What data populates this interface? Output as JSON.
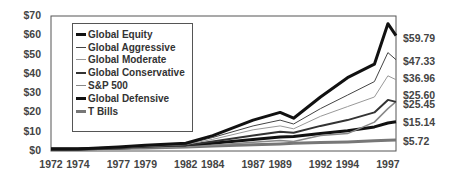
{
  "chart_data": {
    "type": "line",
    "title": "",
    "xlabel": "",
    "ylabel": "",
    "ylim": [
      0,
      70
    ],
    "y_ticks": [
      "$0",
      "$10",
      "$20",
      "$30",
      "$40",
      "$50",
      "$60",
      "$70"
    ],
    "x_ticks": [
      "1972",
      "1974",
      "1977",
      "1979",
      "1982",
      "1984",
      "1987",
      "1989",
      "1992",
      "1994",
      "1997"
    ],
    "grid": false,
    "legend_position": "upper-left-inside",
    "x": [
      1972,
      1974,
      1977,
      1979,
      1982,
      1984,
      1987,
      1989,
      1990,
      1992,
      1994,
      1996,
      1997,
      1997.6
    ],
    "series": [
      {
        "name": "Global Equity",
        "color": "#111111",
        "width": 3,
        "end_label": "$59.79",
        "values": [
          1,
          1,
          2,
          3,
          4,
          8,
          16,
          20,
          17,
          28,
          38,
          45,
          66,
          59.79
        ]
      },
      {
        "name": "Global Aggressive",
        "color": "#444444",
        "width": 1,
        "end_label": "$47.33",
        "values": [
          1,
          1,
          1.8,
          2.7,
          3.6,
          7,
          13,
          16,
          14,
          22,
          29,
          36,
          51,
          47.33
        ]
      },
      {
        "name": "Global Moderate",
        "color": "#999999",
        "width": 1,
        "end_label": "$36.96",
        "values": [
          1,
          1,
          1.7,
          2.4,
          3.3,
          6,
          11,
          13,
          11.5,
          18,
          23,
          28,
          39,
          36.96
        ]
      },
      {
        "name": "Global Conservative",
        "color": "#333333",
        "width": 2,
        "end_label": "$25.45",
        "values": [
          1,
          1,
          1.6,
          2.2,
          3,
          5,
          8,
          10,
          9.5,
          13,
          16,
          20,
          26.5,
          25.45
        ]
      },
      {
        "name": "S&P 500",
        "color": "#888888",
        "width": 1.5,
        "end_label": "$25.60",
        "values": [
          1,
          0.8,
          1.3,
          1.6,
          2,
          3,
          4.5,
          5.5,
          5,
          8,
          9,
          15,
          22,
          25.6
        ]
      },
      {
        "name": "Global Defensive",
        "color": "#111111",
        "width": 3,
        "end_label": "$15.14",
        "values": [
          1,
          1,
          1.5,
          2,
          2.7,
          4,
          6,
          7.2,
          7.5,
          9,
          10.5,
          12.5,
          14.5,
          15.14
        ]
      },
      {
        "name": "T Bills",
        "color": "#777777",
        "width": 3,
        "end_label": "$5.72",
        "values": [
          1,
          1.1,
          1.4,
          1.6,
          2.1,
          2.6,
          3.2,
          3.7,
          4,
          4.4,
          4.7,
          5.3,
          5.6,
          5.72
        ]
      }
    ]
  },
  "end_labels": [
    "$59.79",
    "$47.33",
    "$36.96",
    "$25.60",
    "$25.45",
    "$15.14",
    "$5.72"
  ]
}
